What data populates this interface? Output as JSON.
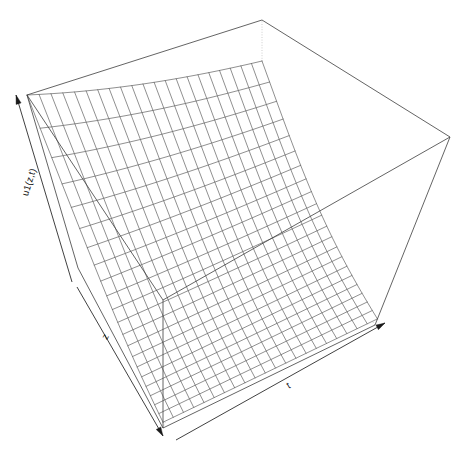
{
  "figure": {
    "kind": "3d-surface-wireframe",
    "background_color": "#ffffff",
    "mesh_color": "#4a4a4a",
    "box_color": "#3c3c3c",
    "box_hidden_color": "#b9b9b9",
    "axis_color": "#1a1a1a",
    "width": 475,
    "height": 456
  },
  "labels": {
    "vertical_axis": "u1(z,t)",
    "depth_axis": "z",
    "horizontal_axis": "t"
  },
  "chart_data": {
    "type": "surface",
    "title": "",
    "xlabel": "t",
    "ylabel": "z",
    "zlabel": "u1(z,t)",
    "grid": false,
    "legend": "none",
    "tick_labels": {
      "t": [],
      "z": [],
      "u1": []
    },
    "xlim": [
      0,
      1
    ],
    "ylim": [
      0,
      1
    ],
    "zlim": [
      0,
      1
    ],
    "n_t_divisions": 21,
    "n_z_divisions": 21,
    "surface_description": "Exponentially decaying surface: maximum at small z, decaying with z; mild decay along t",
    "surface_formula": "u1(z,t) = exp(-3.1*z) * (0.40 + 0.60*exp(-0.62*t))",
    "t": [
      0,
      0.05,
      0.1,
      0.15,
      0.2,
      0.25,
      0.3,
      0.35,
      0.4,
      0.45,
      0.5,
      0.55,
      0.6,
      0.65,
      0.7,
      0.75,
      0.8,
      0.85,
      0.9,
      0.95,
      1
    ],
    "z": [
      0,
      0.05,
      0.1,
      0.15,
      0.2,
      0.25,
      0.3,
      0.35,
      0.4,
      0.45,
      0.5,
      0.55,
      0.6,
      0.65,
      0.7,
      0.75,
      0.8,
      0.85,
      0.9,
      0.95,
      1
    ],
    "z_values_at_t0": [
      1.0,
      0.857,
      0.734,
      0.629,
      0.539,
      0.462,
      0.396,
      0.339,
      0.291,
      0.249,
      0.213,
      0.183,
      0.157,
      0.134,
      0.115,
      0.098,
      0.084,
      0.072,
      0.062,
      0.053,
      0.045
    ],
    "z_values_at_t1": [
      0.723,
      0.62,
      0.531,
      0.455,
      0.39,
      0.334,
      0.286,
      0.245,
      0.21,
      0.18,
      0.154,
      0.132,
      0.113,
      0.097,
      0.083,
      0.071,
      0.061,
      0.052,
      0.045,
      0.038,
      0.033
    ]
  },
  "projection": {
    "theta_deg": 40,
    "phi_deg": 22,
    "box_corners_px": {
      "front_bottom": [
        163,
        428
      ],
      "left_bottom": [
        78,
        268
      ],
      "right_bottom": [
        375,
        325
      ],
      "back_bottom": [
        262,
        168
      ],
      "front_top": [
        163,
        300
      ],
      "left_top": [
        27,
        95
      ],
      "right_top": [
        450,
        137
      ],
      "back_top": [
        262,
        20
      ]
    }
  }
}
